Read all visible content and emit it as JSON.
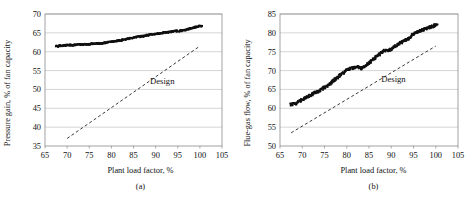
{
  "figure": {
    "background": "#ffffff",
    "ink": "#111111",
    "grid_color": "#b9b9b9",
    "marker_color": "#101010",
    "design_color": "#3a3a3a"
  },
  "panels": [
    {
      "id": "a",
      "caption": "(a)",
      "annotation": "Design",
      "chart_data": {
        "type": "scatter",
        "title": "",
        "xlabel": "Plant load factor, %",
        "ylabel": "Pressure gain, % of fan capacity",
        "xlim": [
          65,
          105
        ],
        "ylim": [
          35,
          70
        ],
        "xticks": [
          65,
          70,
          75,
          80,
          85,
          90,
          95,
          100,
          105
        ],
        "yticks": [
          35,
          40,
          45,
          50,
          55,
          60,
          65,
          70
        ],
        "grid": true,
        "legend": "none",
        "annotations": [
          {
            "text": "Design",
            "x": 91.5,
            "y": 51.5
          }
        ],
        "series": [
          {
            "name": "Measured pressure gain",
            "style": "scatter",
            "marker": "square",
            "x": [
              67.5,
              68.0,
              68.4,
              68.9,
              69.4,
              70.0,
              70.6,
              71.2,
              71.8,
              72.4,
              73.0,
              73.6,
              74.2,
              74.8,
              75.4,
              76.0,
              76.6,
              77.2,
              77.8,
              78.4,
              79.0,
              79.6,
              80.2,
              80.8,
              81.4,
              82.0,
              82.6,
              83.2,
              83.8,
              84.4,
              85.0,
              85.6,
              86.2,
              86.8,
              87.4,
              88.0,
              88.6,
              89.2,
              89.8,
              90.4,
              91.0,
              91.6,
              92.2,
              92.8,
              93.4,
              94.0,
              94.6,
              95.2,
              95.8,
              96.4,
              97.0,
              97.6,
              98.2,
              98.8,
              99.4,
              100.0
            ],
            "y": [
              61.5,
              61.5,
              61.6,
              61.6,
              61.7,
              61.7,
              61.8,
              61.8,
              61.8,
              61.9,
              61.9,
              61.9,
              62.0,
              62.0,
              62.1,
              62.1,
              62.2,
              62.2,
              62.3,
              62.3,
              62.5,
              62.6,
              62.7,
              62.8,
              62.9,
              63.0,
              63.2,
              63.3,
              63.5,
              63.6,
              63.8,
              63.9,
              64.0,
              64.1,
              64.2,
              64.4,
              64.5,
              64.6,
              64.7,
              64.8,
              64.9,
              65.0,
              65.1,
              65.2,
              65.3,
              65.4,
              65.5,
              65.5,
              65.6,
              65.7,
              65.9,
              66.1,
              66.3,
              66.5,
              66.7,
              66.8
            ]
          },
          {
            "name": "Design",
            "style": "dashed-line",
            "x": [
              70.0,
              100.0
            ],
            "y": [
              37.0,
              61.5
            ]
          }
        ]
      }
    },
    {
      "id": "b",
      "caption": "(b)",
      "annotation": "Design",
      "chart_data": {
        "type": "scatter",
        "title": "",
        "xlabel": "Plant load factor, %",
        "ylabel": "Flue-gas flow, % of fan capacity",
        "xlim": [
          65,
          105
        ],
        "ylim": [
          50,
          85
        ],
        "xticks": [
          65,
          70,
          75,
          80,
          85,
          90,
          95,
          100,
          105
        ],
        "yticks": [
          50,
          55,
          60,
          65,
          70,
          75,
          80,
          85
        ],
        "grid": true,
        "legend": "none",
        "annotations": [
          {
            "text": "Design",
            "x": 90.5,
            "y": 67.0
          }
        ],
        "series": [
          {
            "name": "Measured flue-gas flow",
            "style": "scatter",
            "marker": "square",
            "x": [
              67.3,
              67.8,
              68.3,
              68.8,
              69.3,
              69.8,
              70.3,
              70.8,
              71.3,
              71.8,
              72.3,
              72.8,
              73.3,
              73.8,
              74.3,
              74.8,
              75.3,
              75.8,
              76.3,
              76.8,
              77.3,
              77.8,
              78.3,
              78.8,
              79.3,
              79.8,
              80.3,
              80.8,
              81.3,
              81.8,
              82.3,
              82.8,
              83.3,
              83.8,
              84.3,
              84.8,
              85.3,
              85.8,
              86.3,
              86.8,
              87.3,
              87.8,
              88.3,
              88.8,
              89.3,
              89.8,
              90.3,
              90.8,
              91.3,
              91.8,
              92.3,
              92.8,
              93.3,
              93.8,
              94.3,
              94.8,
              95.3,
              95.8,
              96.3,
              96.8,
              97.3,
              97.8,
              98.3,
              98.8,
              99.3,
              99.8
            ],
            "y": [
              61.0,
              61.1,
              61.3,
              61.5,
              61.9,
              62.2,
              62.6,
              62.9,
              63.2,
              63.5,
              63.8,
              64.1,
              64.4,
              64.7,
              65.0,
              65.4,
              65.7,
              66.0,
              66.6,
              67.1,
              67.6,
              68.1,
              68.6,
              69.1,
              69.5,
              69.9,
              70.2,
              70.5,
              70.7,
              70.9,
              71.0,
              70.8,
              70.6,
              70.9,
              71.3,
              71.8,
              72.3,
              72.8,
              73.3,
              73.8,
              74.3,
              74.8,
              75.2,
              75.5,
              75.3,
              75.6,
              76.0,
              76.4,
              76.8,
              77.2,
              77.5,
              77.8,
              78.1,
              78.4,
              78.7,
              79.6,
              79.9,
              80.2,
              80.5,
              80.7,
              80.9,
              81.1,
              81.3,
              81.5,
              81.7,
              82.0
            ]
          },
          {
            "name": "Design",
            "style": "dashed-line",
            "x": [
              67.5,
              100.0
            ],
            "y": [
              53.5,
              76.5
            ]
          }
        ]
      }
    }
  ]
}
